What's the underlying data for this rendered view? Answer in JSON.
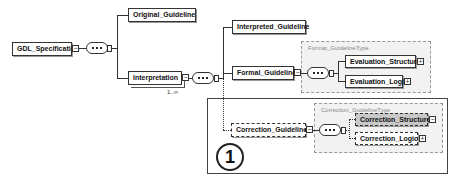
{
  "diagram": {
    "root": {
      "label": "GDL_Specification"
    },
    "level1": [
      {
        "label": "Original_Guideline"
      },
      {
        "label": "Interpretation",
        "occurs": "1..∞"
      }
    ],
    "level2": [
      {
        "label": "Interpreted_Guideline"
      },
      {
        "label": "Formal_Guideline"
      },
      {
        "label": "Correction_Guideline",
        "optional": true
      }
    ],
    "format_type": {
      "label": "Format_GuidelineType",
      "children": [
        {
          "label": "Evaluation_Structure"
        },
        {
          "label": "Evaluation_Logic"
        }
      ]
    },
    "correction_type": {
      "label": "Correction_GuidelineType",
      "children": [
        {
          "label": "Correction_Structure",
          "optional": true,
          "highlighted": true
        },
        {
          "label": "Correction_Logic",
          "optional": true
        }
      ]
    },
    "callout": {
      "number": "1"
    },
    "icons": {
      "expand": "+",
      "collapse": "−"
    }
  }
}
